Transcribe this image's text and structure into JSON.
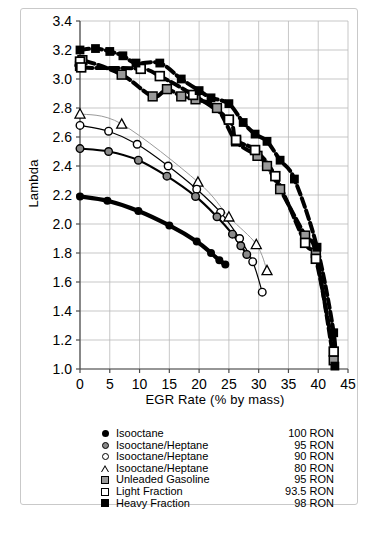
{
  "chart_data": {
    "type": "scatter",
    "title": "",
    "xlabel": "EGR Rate (% by mass)",
    "ylabel": "Lambda",
    "xlim": [
      0,
      45
    ],
    "ylim": [
      1.0,
      3.4
    ],
    "xticks": [
      0,
      5,
      10,
      15,
      20,
      25,
      30,
      35,
      40,
      45
    ],
    "yticks": [
      1.0,
      1.2,
      1.4,
      1.6,
      1.8,
      2.0,
      2.2,
      2.4,
      2.6,
      2.8,
      3.0,
      3.2,
      3.4
    ],
    "xtick_labels": [
      "0",
      "5",
      "10",
      "15",
      "20",
      "25",
      "30",
      "35",
      "40",
      "45"
    ],
    "ytick_labels": [
      "1.0",
      "1.2",
      "1.4",
      "1.6",
      "1.8",
      "2.0",
      "2.2",
      "2.4",
      "2.6",
      "2.8",
      "3.0",
      "3.2",
      "3.4"
    ],
    "grid": true,
    "legend_position": "below-axes",
    "series": [
      {
        "name": "Isooctane",
        "ron": "100 RON",
        "marker": "filled-circle",
        "line": "solid-thick",
        "color": "#000000",
        "points": [
          {
            "x": 0.0,
            "y": 2.19
          },
          {
            "x": 4.6,
            "y": 2.16
          },
          {
            "x": 9.8,
            "y": 2.09
          },
          {
            "x": 15.0,
            "y": 1.99
          },
          {
            "x": 19.6,
            "y": 1.88
          },
          {
            "x": 22.0,
            "y": 1.8
          },
          {
            "x": 23.4,
            "y": 1.75
          },
          {
            "x": 24.4,
            "y": 1.72
          }
        ]
      },
      {
        "name": "Isooctane/Heptane",
        "ron": "95 RON",
        "marker": "gray-circle",
        "line": "solid-medium",
        "color": "#000000",
        "points": [
          {
            "x": 0.0,
            "y": 2.52
          },
          {
            "x": 4.8,
            "y": 2.5
          },
          {
            "x": 9.8,
            "y": 2.44
          },
          {
            "x": 14.6,
            "y": 2.33
          },
          {
            "x": 19.4,
            "y": 2.19
          },
          {
            "x": 23.0,
            "y": 2.05
          },
          {
            "x": 25.6,
            "y": 1.93
          },
          {
            "x": 27.0,
            "y": 1.85
          },
          {
            "x": 28.0,
            "y": 1.79
          }
        ]
      },
      {
        "name": "Isooctane/Heptane",
        "ron": "90 RON",
        "marker": "open-circle",
        "line": "solid-thin",
        "color": "#000000",
        "points": [
          {
            "x": 0.0,
            "y": 2.68
          },
          {
            "x": 4.8,
            "y": 2.64
          },
          {
            "x": 9.6,
            "y": 2.55
          },
          {
            "x": 14.8,
            "y": 2.4
          },
          {
            "x": 19.6,
            "y": 2.24
          },
          {
            "x": 23.6,
            "y": 2.08
          },
          {
            "x": 26.8,
            "y": 1.9
          },
          {
            "x": 29.0,
            "y": 1.74
          },
          {
            "x": 30.6,
            "y": 1.53
          }
        ]
      },
      {
        "name": "Isooctane/Heptane",
        "ron": "80 RON",
        "marker": "open-triangle",
        "line": "solid-light",
        "color": "#9a9a9a",
        "points": [
          {
            "x": 0.0,
            "y": 2.76
          },
          {
            "x": 7.0,
            "y": 2.69
          },
          {
            "x": 19.8,
            "y": 2.29
          },
          {
            "x": 25.0,
            "y": 2.05
          },
          {
            "x": 29.6,
            "y": 1.86
          },
          {
            "x": 31.4,
            "y": 1.68
          }
        ]
      },
      {
        "name": "Unleaded Gasoline",
        "ron": "95 RON",
        "marker": "gray-square",
        "line": "dashed-thick",
        "color": "#000000",
        "points": [
          {
            "x": 0.0,
            "y": 3.09
          },
          {
            "x": 0.4,
            "y": 3.13
          },
          {
            "x": 7.0,
            "y": 3.03
          },
          {
            "x": 12.2,
            "y": 2.88
          },
          {
            "x": 14.6,
            "y": 2.93
          },
          {
            "x": 17.0,
            "y": 2.88
          },
          {
            "x": 19.4,
            "y": 2.86
          },
          {
            "x": 23.0,
            "y": 2.8
          },
          {
            "x": 26.2,
            "y": 2.57
          },
          {
            "x": 29.8,
            "y": 2.47
          },
          {
            "x": 31.4,
            "y": 2.4
          },
          {
            "x": 33.6,
            "y": 2.24
          },
          {
            "x": 37.8,
            "y": 1.92
          },
          {
            "x": 39.6,
            "y": 1.8
          },
          {
            "x": 42.6,
            "y": 1.06
          }
        ]
      },
      {
        "name": "Light Fraction",
        "ron": "93.5 RON",
        "marker": "open-square",
        "line": "dashed-thick",
        "color": "#000000",
        "points": [
          {
            "x": 0.0,
            "y": 3.12
          },
          {
            "x": 0.2,
            "y": 3.08
          },
          {
            "x": 10.2,
            "y": 3.07
          },
          {
            "x": 13.4,
            "y": 3.02
          },
          {
            "x": 19.0,
            "y": 2.89
          },
          {
            "x": 25.0,
            "y": 2.72
          },
          {
            "x": 26.2,
            "y": 2.58
          },
          {
            "x": 29.4,
            "y": 2.51
          },
          {
            "x": 32.8,
            "y": 2.33
          },
          {
            "x": 37.8,
            "y": 1.87
          },
          {
            "x": 39.6,
            "y": 1.76
          },
          {
            "x": 42.6,
            "y": 1.12
          }
        ]
      },
      {
        "name": "Heavy Fraction",
        "ron": "98 RON",
        "marker": "filled-square",
        "line": "dashed-thick",
        "color": "#000000",
        "points": [
          {
            "x": 0.0,
            "y": 3.2
          },
          {
            "x": 2.6,
            "y": 3.21
          },
          {
            "x": 5.0,
            "y": 3.19
          },
          {
            "x": 7.2,
            "y": 3.16
          },
          {
            "x": 9.4,
            "y": 3.11
          },
          {
            "x": 13.4,
            "y": 3.11
          },
          {
            "x": 17.0,
            "y": 3.0
          },
          {
            "x": 20.0,
            "y": 2.92
          },
          {
            "x": 22.0,
            "y": 2.87
          },
          {
            "x": 25.0,
            "y": 2.83
          },
          {
            "x": 27.4,
            "y": 2.7
          },
          {
            "x": 29.4,
            "y": 2.62
          },
          {
            "x": 31.4,
            "y": 2.57
          },
          {
            "x": 33.6,
            "y": 2.44
          },
          {
            "x": 36.0,
            "y": 2.31
          },
          {
            "x": 39.8,
            "y": 1.84
          },
          {
            "x": 42.6,
            "y": 1.25
          },
          {
            "x": 42.8,
            "y": 1.02
          }
        ]
      }
    ]
  },
  "axes": {
    "x_title": "EGR Rate (% by mass)",
    "y_title": "Lambda"
  },
  "legend": {
    "items": [
      {
        "marker": "filled-circle",
        "name": "Isooctane",
        "ron": "100 RON"
      },
      {
        "marker": "gray-circle",
        "name": "Isooctane/Heptane",
        "ron": "95 RON"
      },
      {
        "marker": "open-circle",
        "name": "Isooctane/Heptane",
        "ron": "90 RON"
      },
      {
        "marker": "open-triangle",
        "name": "Isooctane/Heptane",
        "ron": "80 RON"
      },
      {
        "marker": "gray-square",
        "name": "Unleaded Gasoline",
        "ron": "95 RON"
      },
      {
        "marker": "open-square",
        "name": "Light Fraction",
        "ron": "93.5 RON"
      },
      {
        "marker": "filled-square",
        "name": "Heavy Fraction",
        "ron": "98 RON"
      }
    ]
  },
  "colors": {
    "axis": "#000000",
    "grid": "#b9b9b9",
    "frame": "#c9c9c9",
    "gray_marker": "#9a9a9a"
  }
}
